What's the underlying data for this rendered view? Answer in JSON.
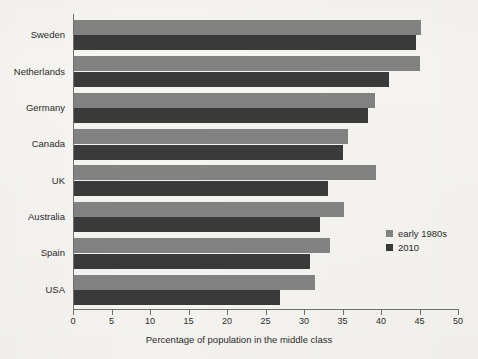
{
  "chart_data": {
    "type": "bar",
    "orientation": "horizontal",
    "title": "",
    "xlabel": "Percentage of population in the middle class",
    "ylabel": "",
    "xlim": [
      0,
      50
    ],
    "xticks": [
      0,
      5,
      10,
      15,
      20,
      25,
      30,
      35,
      40,
      45,
      50
    ],
    "xtick_labels": [
      "0",
      "5",
      "10",
      "15",
      "20",
      "25",
      "30",
      "35",
      "40",
      "45",
      "50"
    ],
    "grid": false,
    "legend_position": "center right",
    "categories": [
      "Sweden",
      "Netherlands",
      "Germany",
      "Canada",
      "UK",
      "Australia",
      "Spain",
      "USA"
    ],
    "series": [
      {
        "name": "early 1980s",
        "color": "#818181",
        "values": [
          45.2,
          45.0,
          39.2,
          35.7,
          39.4,
          35.2,
          33.4,
          31.4
        ]
      },
      {
        "name": "2010",
        "color": "#3a3a3a",
        "values": [
          44.5,
          41.0,
          38.3,
          35.0,
          33.1,
          32.1,
          30.8,
          26.9
        ]
      }
    ]
  },
  "legend": {
    "entries": [
      {
        "label": "early 1980s",
        "color": "#818181"
      },
      {
        "label": "2010",
        "color": "#3a3a3a"
      }
    ]
  },
  "axis": {
    "x_title": "Percentage of population in the middle class"
  },
  "colors": {
    "background": "#f6f5f1",
    "axis": "#6f6f6f",
    "text": "#2b2b2b",
    "series_early_1980s": "#818181",
    "series_2010": "#3a3a3a"
  }
}
